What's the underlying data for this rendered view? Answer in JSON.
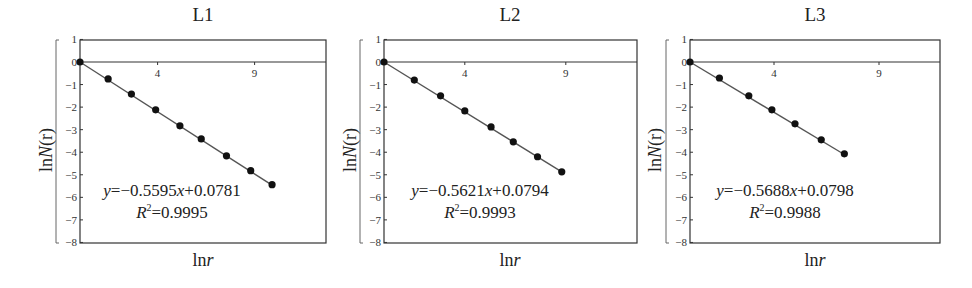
{
  "chart_data": [
    {
      "type": "scatter",
      "title": "L1",
      "xlabel": "lnr",
      "ylabel": "lnN(r)",
      "x": [
        0,
        1.45,
        2.65,
        3.9,
        5.15,
        6.25,
        7.55,
        8.8,
        9.9
      ],
      "y": [
        0,
        -0.75,
        -1.42,
        -2.12,
        -2.83,
        -3.41,
        -4.16,
        -4.82,
        -5.44
      ],
      "fit": {
        "slope": -0.5595,
        "intercept": 0.0781,
        "r2": 0.9995
      },
      "equation": "y=−0.5595x+0.0781",
      "r2_label": "R²=0.9995",
      "xticks": [
        4,
        9
      ],
      "yticks": [
        1,
        0,
        -1,
        -2,
        -3,
        -4,
        -5,
        -6,
        -7,
        -8
      ],
      "ylim": [
        -8,
        1
      ],
      "xlim": [
        0,
        12.7
      ],
      "grid": false,
      "legend": null
    },
    {
      "type": "scatter",
      "title": "L2",
      "xlabel": "lnr",
      "ylabel": "lnN(r)",
      "x": [
        0,
        1.5,
        2.8,
        4.0,
        5.3,
        6.4,
        7.6,
        8.8
      ],
      "y": [
        0,
        -0.8,
        -1.5,
        -2.17,
        -2.88,
        -3.54,
        -4.2,
        -4.87
      ],
      "fit": {
        "slope": -0.5621,
        "intercept": 0.0794,
        "r2": 0.9993
      },
      "equation": "y=−0.5621x+0.0794",
      "r2_label": "R²=0.9993",
      "xticks": [
        4,
        9
      ],
      "yticks": [
        1,
        0,
        -1,
        -2,
        -3,
        -4,
        -5,
        -6,
        -7,
        -8
      ],
      "ylim": [
        -8,
        1
      ],
      "xlim": [
        0,
        12.5
      ],
      "grid": false,
      "legend": null
    },
    {
      "type": "scatter",
      "title": "L3",
      "xlabel": "lnr",
      "ylabel": "lnN(r)",
      "x": [
        0,
        1.4,
        2.8,
        3.9,
        5.0,
        6.25,
        7.35
      ],
      "y": [
        0,
        -0.71,
        -1.5,
        -2.12,
        -2.74,
        -3.45,
        -4.07
      ],
      "fit": {
        "slope": -0.5688,
        "intercept": 0.0798,
        "r2": 0.9988
      },
      "equation": "y=−0.5688x+0.0798",
      "r2_label": "R²=0.9988",
      "xticks": [
        4,
        9
      ],
      "yticks": [
        1,
        0,
        -1,
        -2,
        -3,
        -4,
        -5,
        -6,
        -7,
        -8
      ],
      "ylim": [
        -8,
        1
      ],
      "xlim": [
        0,
        11.9
      ],
      "grid": false,
      "legend": null
    }
  ],
  "panels": [
    {
      "title": "L1",
      "xlabel_prefix": "ln",
      "xlabel_var": "r",
      "ylabel_prefix": "ln",
      "ylabel_var": "N",
      "ylabel_suffix": "(r)",
      "eq_prefix": "y",
      "eq_body": "=−0.5595",
      "eq_var": "x",
      "eq_tail": "+0.0781",
      "r2_var": "R",
      "r2_sup": "2",
      "r2_val": "=0.9995"
    },
    {
      "title": "L2",
      "xlabel_prefix": "ln",
      "xlabel_var": "r",
      "ylabel_prefix": "ln",
      "ylabel_var": "N",
      "ylabel_suffix": "(r)",
      "eq_prefix": "y",
      "eq_body": "=−0.5621",
      "eq_var": "x",
      "eq_tail": "+0.0794",
      "r2_var": "R",
      "r2_sup": "2",
      "r2_val": "=0.9993"
    },
    {
      "title": "L3",
      "xlabel_prefix": "ln",
      "xlabel_var": "r",
      "ylabel_prefix": "ln",
      "ylabel_var": "N",
      "ylabel_suffix": "(r)",
      "eq_prefix": "y",
      "eq_body": "=−0.5688",
      "eq_var": "x",
      "eq_tail": "+0.0798",
      "r2_var": "R",
      "r2_sup": "2",
      "r2_val": "=0.9988"
    }
  ],
  "colors": {
    "axis": "#333333",
    "line": "#555555",
    "marker": "#111111",
    "background": "#ffffff"
  }
}
